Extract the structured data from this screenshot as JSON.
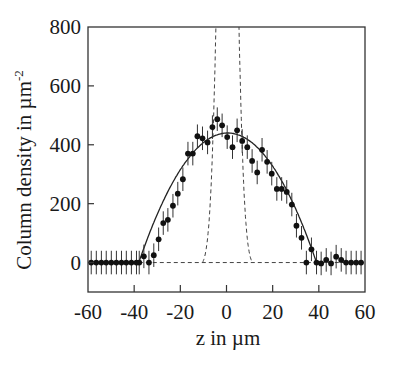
{
  "chart_data": {
    "type": "scatter",
    "title": "",
    "xlabel": "z in µm",
    "ylabel": "Column density in µm",
    "ylabel_superscript": "-2",
    "xlim": [
      -60,
      60
    ],
    "ylim": [
      -100,
      800
    ],
    "xticks": [
      -60,
      -40,
      -20,
      0,
      20,
      40,
      60
    ],
    "yticks": [
      0,
      200,
      400,
      600,
      800
    ],
    "xtick_labels": [
      "-60",
      "-40",
      "-20",
      "0",
      "20",
      "40",
      "60"
    ],
    "ytick_labels": [
      "0",
      "200",
      "400",
      "600",
      "800"
    ],
    "grid": false,
    "legend": null,
    "series": [
      {
        "name": "measured column density",
        "style": "markers with vertical error bars",
        "color": "#111111",
        "error": 40,
        "x": [
          -58.6,
          -56.4,
          -54.2,
          -52.1,
          -49.9,
          -47.7,
          -45.5,
          -43.4,
          -41.2,
          -39.0,
          -37.8,
          -35.8,
          -33.6,
          -31.5,
          -29.4,
          -27.4,
          -25.4,
          -23.2,
          -21.1,
          -18.9,
          -16.7,
          -14.6,
          -12.6,
          -10.4,
          -8.2,
          -6.1,
          -4.0,
          -1.9,
          0.3,
          2.6,
          4.6,
          6.8,
          9.0,
          11.1,
          13.3,
          15.4,
          17.6,
          19.6,
          21.8,
          23.9,
          26.1,
          28.3,
          30.3,
          32.5,
          34.6,
          36.8,
          39.0,
          41.0,
          43.2,
          45.3,
          47.5,
          49.7,
          51.8,
          54.0,
          56.2,
          58.3
        ],
        "y": [
          0,
          0,
          0,
          0,
          0,
          0,
          0,
          0,
          0,
          0,
          0,
          21,
          0,
          25,
          79,
          134,
          145,
          193,
          234,
          283,
          370,
          370,
          429,
          422,
          408,
          460,
          487,
          466,
          426,
          392,
          449,
          413,
          392,
          345,
          306,
          383,
          342,
          302,
          250,
          250,
          240,
          197,
          125,
          84,
          0,
          45,
          0,
          -3,
          9,
          -3,
          20,
          9,
          0,
          0,
          0,
          0
        ]
      },
      {
        "name": "Thomas-Fermi fit",
        "style": "solid line",
        "color": "#222222",
        "model": "inverted parabola",
        "peak": 440,
        "center": 0.5,
        "half_width": 38.5
      },
      {
        "name": "narrow profile",
        "style": "dashed line",
        "color": "#444444",
        "model": "gaussian",
        "center": 0.4,
        "sigma": 3.4,
        "peak": 2400,
        "cutoff_half_width": 10.8
      },
      {
        "name": "baseline",
        "style": "dashed line",
        "color": "#444444",
        "y_value": 0,
        "x_range": [
          -38,
          58
        ]
      }
    ]
  }
}
